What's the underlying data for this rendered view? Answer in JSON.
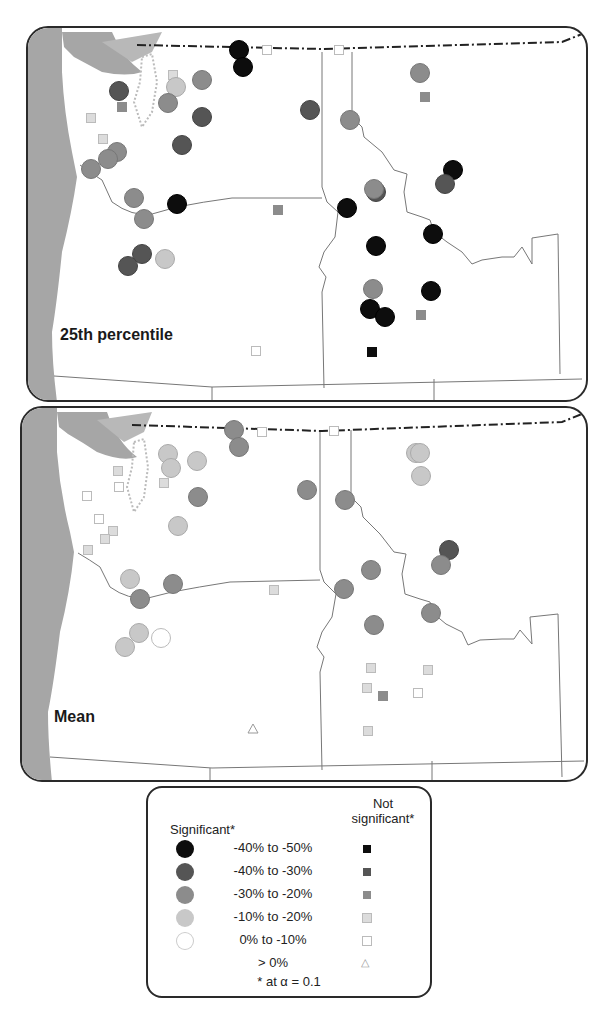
{
  "maps": [
    {
      "id": "p25",
      "label": "25th percentile",
      "sites": [
        {
          "x": 237,
          "y": 48,
          "t": "c",
          "k": 0
        },
        {
          "x": 241,
          "y": 65,
          "t": "c",
          "k": 0
        },
        {
          "x": 265,
          "y": 48,
          "t": "s",
          "k": 4
        },
        {
          "x": 337,
          "y": 48,
          "t": "s",
          "k": 4
        },
        {
          "x": 117,
          "y": 89,
          "t": "c",
          "k": 1
        },
        {
          "x": 120,
          "y": 105,
          "t": "s",
          "k": 2
        },
        {
          "x": 171,
          "y": 73,
          "t": "s",
          "k": 3
        },
        {
          "x": 174,
          "y": 85,
          "t": "c",
          "k": 3
        },
        {
          "x": 200,
          "y": 78,
          "t": "c",
          "k": 2
        },
        {
          "x": 166,
          "y": 101,
          "t": "c",
          "k": 2
        },
        {
          "x": 200,
          "y": 115,
          "t": "c",
          "k": 1
        },
        {
          "x": 180,
          "y": 143,
          "t": "c",
          "k": 1
        },
        {
          "x": 89,
          "y": 116,
          "t": "s",
          "k": 3
        },
        {
          "x": 101,
          "y": 137,
          "t": "s",
          "k": 3
        },
        {
          "x": 115,
          "y": 150,
          "t": "c",
          "k": 2
        },
        {
          "x": 106,
          "y": 157,
          "t": "c",
          "k": 2
        },
        {
          "x": 89,
          "y": 167,
          "t": "c",
          "k": 2
        },
        {
          "x": 132,
          "y": 196,
          "t": "c",
          "k": 2
        },
        {
          "x": 175,
          "y": 202,
          "t": "c",
          "k": 0
        },
        {
          "x": 142,
          "y": 217,
          "t": "c",
          "k": 2
        },
        {
          "x": 276,
          "y": 208,
          "t": "s",
          "k": 2
        },
        {
          "x": 308,
          "y": 108,
          "t": "c",
          "k": 1
        },
        {
          "x": 348,
          "y": 118,
          "t": "c",
          "k": 2
        },
        {
          "x": 418,
          "y": 71,
          "t": "c",
          "k": 2
        },
        {
          "x": 423,
          "y": 95,
          "t": "s",
          "k": 2
        },
        {
          "x": 451,
          "y": 168,
          "t": "c",
          "k": 0
        },
        {
          "x": 443,
          "y": 182,
          "t": "c",
          "k": 1
        },
        {
          "x": 374,
          "y": 190,
          "t": "c",
          "k": 1
        },
        {
          "x": 372,
          "y": 187,
          "t": "c",
          "k": 2
        },
        {
          "x": 345,
          "y": 206,
          "t": "c",
          "k": 0
        },
        {
          "x": 431,
          "y": 232,
          "t": "c",
          "k": 0
        },
        {
          "x": 374,
          "y": 244,
          "t": "c",
          "k": 0
        },
        {
          "x": 140,
          "y": 252,
          "t": "c",
          "k": 1
        },
        {
          "x": 126,
          "y": 264,
          "t": "c",
          "k": 1
        },
        {
          "x": 163,
          "y": 257,
          "t": "c",
          "k": 3
        },
        {
          "x": 371,
          "y": 287,
          "t": "c",
          "k": 2
        },
        {
          "x": 429,
          "y": 289,
          "t": "c",
          "k": 0
        },
        {
          "x": 368,
          "y": 307,
          "t": "c",
          "k": 0
        },
        {
          "x": 383,
          "y": 315,
          "t": "c",
          "k": 0
        },
        {
          "x": 419,
          "y": 313,
          "t": "s",
          "k": 2
        },
        {
          "x": 254,
          "y": 349,
          "t": "s",
          "k": 4
        },
        {
          "x": 370,
          "y": 350,
          "t": "s",
          "k": 0
        }
      ]
    },
    {
      "id": "mean",
      "label": "Mean",
      "sites": [
        {
          "x": 232,
          "y": 428,
          "t": "c",
          "k": 2
        },
        {
          "x": 237,
          "y": 445,
          "t": "c",
          "k": 2
        },
        {
          "x": 260,
          "y": 430,
          "t": "s",
          "k": 4
        },
        {
          "x": 332,
          "y": 429,
          "t": "s",
          "k": 4
        },
        {
          "x": 166,
          "y": 452,
          "t": "c",
          "k": 3
        },
        {
          "x": 169,
          "y": 466,
          "t": "c",
          "k": 3
        },
        {
          "x": 195,
          "y": 459,
          "t": "c",
          "k": 3
        },
        {
          "x": 162,
          "y": 481,
          "t": "s",
          "k": 3
        },
        {
          "x": 116,
          "y": 469,
          "t": "s",
          "k": 3
        },
        {
          "x": 117,
          "y": 485,
          "t": "s",
          "k": 4
        },
        {
          "x": 85,
          "y": 494,
          "t": "s",
          "k": 4
        },
        {
          "x": 196,
          "y": 495,
          "t": "c",
          "k": 2
        },
        {
          "x": 97,
          "y": 517,
          "t": "s",
          "k": 4
        },
        {
          "x": 111,
          "y": 529,
          "t": "s",
          "k": 3
        },
        {
          "x": 103,
          "y": 537,
          "t": "s",
          "k": 3
        },
        {
          "x": 86,
          "y": 548,
          "t": "s",
          "k": 3
        },
        {
          "x": 176,
          "y": 524,
          "t": "c",
          "k": 3
        },
        {
          "x": 128,
          "y": 577,
          "t": "c",
          "k": 3
        },
        {
          "x": 171,
          "y": 582,
          "t": "c",
          "k": 2
        },
        {
          "x": 138,
          "y": 597,
          "t": "c",
          "k": 2
        },
        {
          "x": 272,
          "y": 588,
          "t": "s",
          "k": 3
        },
        {
          "x": 305,
          "y": 488,
          "t": "c",
          "k": 2
        },
        {
          "x": 343,
          "y": 498,
          "t": "c",
          "k": 2
        },
        {
          "x": 414,
          "y": 451,
          "t": "c",
          "k": 3
        },
        {
          "x": 418,
          "y": 451,
          "t": "c",
          "k": 3
        },
        {
          "x": 419,
          "y": 474,
          "t": "c",
          "k": 3
        },
        {
          "x": 447,
          "y": 548,
          "t": "c",
          "k": 1
        },
        {
          "x": 439,
          "y": 563,
          "t": "c",
          "k": 2
        },
        {
          "x": 369,
          "y": 568,
          "t": "c",
          "k": 2
        },
        {
          "x": 342,
          "y": 587,
          "t": "c",
          "k": 2
        },
        {
          "x": 137,
          "y": 631,
          "t": "c",
          "k": 3
        },
        {
          "x": 123,
          "y": 645,
          "t": "c",
          "k": 3
        },
        {
          "x": 159,
          "y": 636,
          "t": "c",
          "k": 4
        },
        {
          "x": 372,
          "y": 623,
          "t": "c",
          "k": 2
        },
        {
          "x": 429,
          "y": 611,
          "t": "c",
          "k": 2
        },
        {
          "x": 369,
          "y": 666,
          "t": "s",
          "k": 3
        },
        {
          "x": 426,
          "y": 668,
          "t": "s",
          "k": 3
        },
        {
          "x": 365,
          "y": 686,
          "t": "s",
          "k": 3
        },
        {
          "x": 381,
          "y": 694,
          "t": "s",
          "k": 2
        },
        {
          "x": 416,
          "y": 691,
          "t": "s",
          "k": 4
        },
        {
          "x": 366,
          "y": 729,
          "t": "s",
          "k": 3
        },
        {
          "x": 251,
          "y": 727,
          "t": "t",
          "k": 5
        }
      ]
    }
  ],
  "legend": {
    "significant_header": "Significant*",
    "not_significant_header_1": "Not",
    "not_significant_header_2": "significant*",
    "classes": [
      {
        "label": "-40% to -50%",
        "fill": "#0d0d0d",
        "stroke": "#000000"
      },
      {
        "label": "-40% to -30%",
        "fill": "#555555",
        "stroke": "#444444"
      },
      {
        "label": "-30% to -20%",
        "fill": "#8c8c8c",
        "stroke": "#777777"
      },
      {
        "label": "-10% to -20%",
        "fill": "#c8c8c8",
        "stroke": "#aaaaaa"
      },
      {
        "label": "0% to -10%",
        "fill": "#ffffff",
        "stroke": "#bbbbbb"
      },
      {
        "label": "> 0%",
        "fill": "none",
        "stroke": "#999999"
      }
    ],
    "footnote": "* at α = 0.1"
  }
}
